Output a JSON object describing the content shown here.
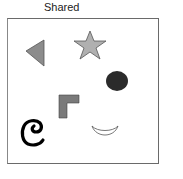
{
  "title": "Shared",
  "shapes": [
    {
      "type": "triangle",
      "name": "left-pointing triangle",
      "fill": "#8c8c8c"
    },
    {
      "type": "star",
      "name": "five-point star",
      "fill": "#b0b0b0"
    },
    {
      "type": "circle",
      "name": "dark circle",
      "fill": "#2b2b2b"
    },
    {
      "type": "l-shape",
      "name": "gray L-shape",
      "fill": "#7a7a7a"
    },
    {
      "type": "glyph",
      "name": "curl glyph",
      "text": "e",
      "fill": "#000000"
    },
    {
      "type": "crescent",
      "name": "smile crescent",
      "fill": "#ffffff"
    }
  ],
  "colors": {
    "border": "#6a6a6a",
    "stroke": "#555555"
  }
}
